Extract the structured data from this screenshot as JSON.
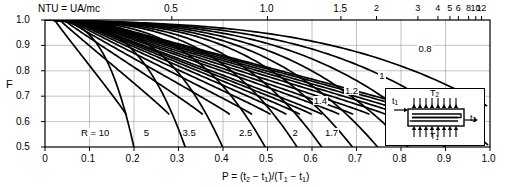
{
  "chart_data": {
    "type": "line",
    "title": "",
    "xlabel": "P = (t2 - t1)/(T1 - t1)",
    "ylabel": "F",
    "top_axis_label": "NTU = UA/mc",
    "xlim": [
      0,
      1.0
    ],
    "ylim": [
      0.5,
      1.0
    ],
    "grid": true,
    "x_ticks": [
      "0",
      "0.1",
      "0.2",
      "0.3",
      "0.4",
      "0.5",
      "0.6",
      "0.7",
      "0.8",
      "0.9",
      "1.0"
    ],
    "x_tick_values": [
      0,
      0.1,
      0.2,
      0.3,
      0.4,
      0.5,
      0.6,
      0.7,
      0.8,
      0.9,
      1.0
    ],
    "y_ticks": [
      "0.5",
      "0.6",
      "0.7",
      "0.8",
      "0.9",
      "1.0"
    ],
    "y_tick_values": [
      0.5,
      0.6,
      0.7,
      0.8,
      0.9,
      1.0
    ],
    "top_ticks": [
      "0.5",
      "1.0",
      "1.5",
      "2",
      "3",
      "4",
      "5",
      "6",
      "8",
      "10",
      "12"
    ],
    "top_tick_positions": [
      0.285,
      0.5,
      0.665,
      0.745,
      0.838,
      0.883,
      0.91,
      0.929,
      0.952,
      0.968,
      0.981
    ],
    "r_curve_labels": [
      {
        "text": "R = 10",
        "x": 0.115,
        "y": 0.552
      },
      {
        "text": "5",
        "x": 0.226,
        "y": 0.552
      },
      {
        "text": "3.5",
        "x": 0.325,
        "y": 0.552
      },
      {
        "text": "2.5",
        "x": 0.452,
        "y": 0.552
      },
      {
        "text": "2",
        "x": 0.56,
        "y": 0.552
      },
      {
        "text": "1.7",
        "x": 0.645,
        "y": 0.552
      },
      {
        "text": "1.4",
        "x": 0.62,
        "y": 0.678
      },
      {
        "text": "1.2",
        "x": 0.69,
        "y": 0.718
      },
      {
        "text": "1",
        "x": 0.755,
        "y": 0.775
      },
      {
        "text": "0.8",
        "x": 0.855,
        "y": 0.88
      }
    ],
    "series_note": "Two families of curves: steep R-parameter curves and shallow NTU curves forming the LMTD correction-factor chart",
    "legend_position": "none"
  },
  "inset": {
    "name": "shell-and-tube-heat-exchanger-schematic",
    "labels": {
      "t1": "t1",
      "t2": "t2",
      "T1": "T1",
      "T2": "T2"
    }
  }
}
